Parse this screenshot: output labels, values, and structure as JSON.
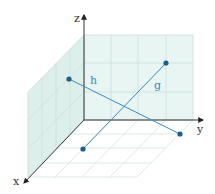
{
  "diagram": {
    "type": "3d-coordinate-system",
    "axes": {
      "x": {
        "label": "x"
      },
      "y": {
        "label": "y"
      },
      "z": {
        "label": "z"
      }
    },
    "colors": {
      "axis": "#333333",
      "grid": "#c5dcd8",
      "wall_fill": "#e4f3f1",
      "line": "#3a8cc0",
      "point": "#1f5f85",
      "line_label": "#3a8cc0"
    },
    "lines": [
      {
        "name": "h",
        "label": "h"
      },
      {
        "name": "g",
        "label": "g"
      }
    ]
  }
}
